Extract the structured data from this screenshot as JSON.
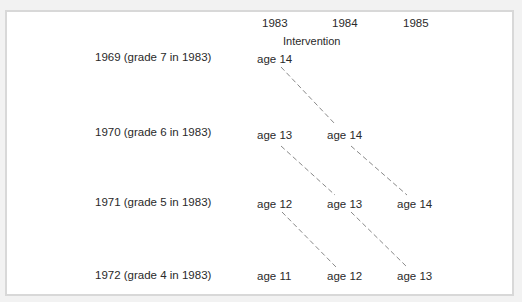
{
  "header": {
    "years": [
      "1983",
      "1984",
      "1985"
    ],
    "intervention_label": "Intervention"
  },
  "rows": [
    {
      "label": "1969 (grade 7 in 1983)",
      "ages": [
        "age 14",
        "",
        ""
      ]
    },
    {
      "label": "1970 (grade 6 in 1983)",
      "ages": [
        "age 13",
        "age 14",
        ""
      ]
    },
    {
      "label": "1971 (grade 5 in 1983)",
      "ages": [
        "age 12",
        "age 13",
        "age 14"
      ]
    },
    {
      "label": "1972 (grade 4 in 1983)",
      "ages": [
        "age 11",
        "age 12",
        "age 13"
      ]
    }
  ],
  "connectors": [
    {
      "from": "1969-1983",
      "to": "1970-1984"
    },
    {
      "from": "1970-1983",
      "to": "1971-1984"
    },
    {
      "from": "1970-1984",
      "to": "1971-1985"
    },
    {
      "from": "1971-1983",
      "to": "1972-1984"
    },
    {
      "from": "1971-1984",
      "to": "1972-1985"
    }
  ],
  "colors": {
    "line": "#7a7a7a",
    "text": "#2a2a2a",
    "border": "#d8d8d8"
  }
}
